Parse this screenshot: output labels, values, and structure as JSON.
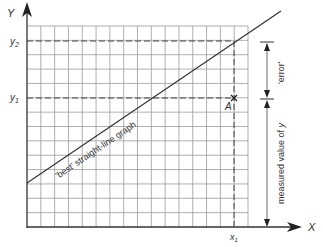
{
  "diagram": {
    "axes": {
      "y_label": "Y",
      "x_label": "X"
    },
    "tick_labels": {
      "y2": "y",
      "y2_sub": "2",
      "y1": "y",
      "y1_sub": "1",
      "x1": "x",
      "x1_sub": "1"
    },
    "grid": {
      "columns": 16,
      "rows": 14
    },
    "best_line_label": "'best' straight-line graph",
    "point_label": "A",
    "error_label": "'error'",
    "measured_label": "measured value of ",
    "measured_label_var": "y",
    "colors": {
      "grid": "#9a9a9a",
      "line": "#333333",
      "axis": "#333333",
      "text": "#333333"
    }
  }
}
